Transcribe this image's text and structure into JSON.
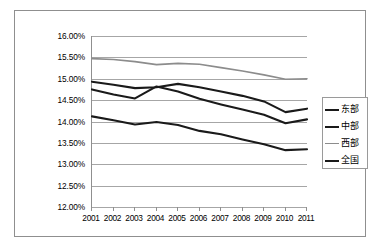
{
  "chart_data": {
    "type": "line",
    "title": "",
    "xlabel": "",
    "ylabel": "",
    "categories": [
      "2001",
      "2002",
      "2003",
      "2004",
      "2005",
      "2006",
      "2007",
      "2008",
      "2009",
      "2010",
      "2011"
    ],
    "x": [
      2001,
      2002,
      2003,
      2004,
      2005,
      2006,
      2007,
      2008,
      2009,
      2010,
      2011
    ],
    "ylim": [
      12.0,
      16.0
    ],
    "ytick_labels": [
      "16.00%",
      "15.50%",
      "15.00%",
      "14.50%",
      "14.00%",
      "13.50%",
      "13.00%",
      "12.50%",
      "12.00%"
    ],
    "ytick_values": [
      16.0,
      15.5,
      15.0,
      14.5,
      14.0,
      13.5,
      13.0,
      12.5,
      12.0
    ],
    "grid": true,
    "legend_position": "right",
    "series": [
      {
        "name": "东部",
        "color": "#1a1a1a",
        "width": 2.1,
        "values": [
          14.93,
          14.86,
          14.78,
          14.8,
          14.88,
          14.8,
          14.7,
          14.6,
          14.47,
          14.22,
          14.3
        ]
      },
      {
        "name": "中部",
        "color": "#1a1a1a",
        "width": 2.1,
        "values": [
          14.75,
          14.63,
          14.54,
          14.82,
          14.7,
          14.53,
          14.4,
          14.28,
          14.16,
          13.96,
          14.05
        ]
      },
      {
        "name": "西部",
        "color": "#8c8c8c",
        "width": 1.6,
        "values": [
          15.47,
          15.45,
          15.4,
          15.33,
          15.36,
          15.34,
          15.26,
          15.18,
          15.09,
          14.99,
          15.0
        ]
      },
      {
        "name": "全国",
        "color": "#1a1a1a",
        "width": 2.1,
        "values": [
          14.12,
          14.03,
          13.93,
          13.99,
          13.92,
          13.78,
          13.7,
          13.58,
          13.47,
          13.33,
          13.35
        ]
      }
    ]
  },
  "legend": {
    "items": [
      {
        "label": "东部",
        "color": "#1a1a1a"
      },
      {
        "label": "中部",
        "color": "#1a1a1a"
      },
      {
        "label": "西部",
        "color": "#8c8c8c"
      },
      {
        "label": "全国",
        "color": "#1a1a1a"
      }
    ]
  }
}
